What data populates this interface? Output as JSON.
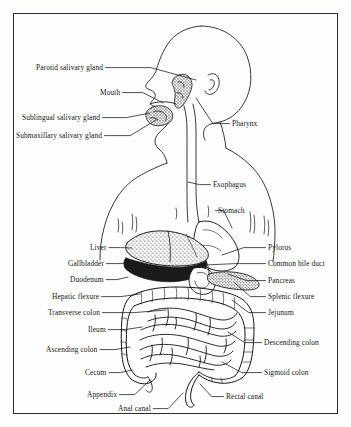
{
  "figure": {
    "type": "anatomical-line-diagram",
    "style": "black ink line art with stippled organ shading on white background",
    "border_color": "#2b2b2b",
    "ink_color": "#151515",
    "background_color": "#fefefe"
  },
  "labels_left": [
    {
      "id": "parotid-salivary-gland",
      "text": "Parotid salivary gland",
      "x": 36,
      "y": 63,
      "leader_to_x": 196,
      "leader_to_y": 80
    },
    {
      "id": "mouth",
      "text": "Mouth",
      "x": 100,
      "y": 88,
      "leader_to_x": 163,
      "leader_to_y": 103
    },
    {
      "id": "sublingual-salivary-gland",
      "text": "Sublingual salivary gland",
      "x": 22,
      "y": 113,
      "leader_to_x": 150,
      "leader_to_y": 113
    },
    {
      "id": "submaxillary-salivary-gland",
      "text": "Submaxillary salivary gland",
      "x": 16,
      "y": 131,
      "leader_to_x": 156,
      "leader_to_y": 120
    },
    {
      "id": "liver",
      "text": "Liver",
      "x": 90,
      "y": 243,
      "leader_to_x": 132,
      "leader_to_y": 248
    },
    {
      "id": "gallbladder",
      "text": "Gallbladder",
      "x": 68,
      "y": 259,
      "leader_to_x": 128,
      "leader_to_y": 263
    },
    {
      "id": "duodenum",
      "text": "Duodenum",
      "x": 70,
      "y": 275,
      "leader_to_x": 128,
      "leader_to_y": 277
    },
    {
      "id": "hepatic-flexure",
      "text": "Hepatic flexure",
      "x": 52,
      "y": 292,
      "leader_to_x": 140,
      "leader_to_y": 294
    },
    {
      "id": "transverse-colon",
      "text": "Transverse colon",
      "x": 48,
      "y": 308,
      "leader_to_x": 166,
      "leader_to_y": 310
    },
    {
      "id": "ileum",
      "text": "Ileum",
      "x": 88,
      "y": 325,
      "leader_to_x": 142,
      "leader_to_y": 327
    },
    {
      "id": "ascending-colon",
      "text": "Ascending colon",
      "x": 46,
      "y": 345,
      "leader_to_x": 130,
      "leader_to_y": 347
    },
    {
      "id": "cecum",
      "text": "Cecum",
      "x": 85,
      "y": 368,
      "leader_to_x": 132,
      "leader_to_y": 370
    },
    {
      "id": "appendix",
      "text": "Appendix",
      "x": 87,
      "y": 390,
      "leader_to_x": 150,
      "leader_to_y": 380
    },
    {
      "id": "anal-canal",
      "text": "Anal canal",
      "x": 118,
      "y": 404,
      "leader_to_x": 183,
      "leader_to_y": 393
    }
  ],
  "labels_right": [
    {
      "id": "pharynx",
      "text": "Pharynx",
      "x": 232,
      "y": 119,
      "leader_to_x": 196,
      "leader_to_y": 98
    },
    {
      "id": "esophagus",
      "text": "Esophagus",
      "x": 213,
      "y": 180,
      "leader_to_x": 188,
      "leader_to_y": 182
    },
    {
      "id": "stomach",
      "text": "Stomach",
      "x": 218,
      "y": 206,
      "leader_to_x": 232,
      "leader_to_y": 228
    },
    {
      "id": "pylorus",
      "text": "Pylorus",
      "x": 268,
      "y": 243,
      "leader_to_x": 222,
      "leader_to_y": 255
    },
    {
      "id": "common-bile-duct",
      "text": "Common bile duct",
      "x": 268,
      "y": 259,
      "leader_to_x": 205,
      "leader_to_y": 265
    },
    {
      "id": "pancreas",
      "text": "Pancreas",
      "x": 268,
      "y": 276,
      "leader_to_x": 228,
      "leader_to_y": 274
    },
    {
      "id": "splenic-flexure",
      "text": "Splenic flexure",
      "x": 268,
      "y": 292,
      "leader_to_x": 235,
      "leader_to_y": 283
    },
    {
      "id": "jejunum",
      "text": "Jejunum",
      "x": 268,
      "y": 308,
      "leader_to_x": 232,
      "leader_to_y": 300
    },
    {
      "id": "descending-colon",
      "text": "Descending colon",
      "x": 264,
      "y": 338,
      "leader_to_x": 228,
      "leader_to_y": 332
    },
    {
      "id": "sigmoid-colon",
      "text": "Sigmoid colon",
      "x": 264,
      "y": 368,
      "leader_to_x": 222,
      "leader_to_y": 362
    },
    {
      "id": "rectal-canal",
      "text": "Rectal canal",
      "x": 226,
      "y": 392,
      "leader_to_x": 200,
      "leader_to_y": 384
    }
  ]
}
